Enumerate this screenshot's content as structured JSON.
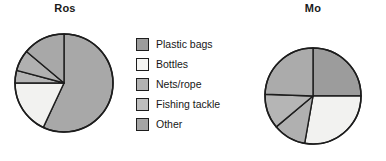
{
  "chart_data": [
    {
      "type": "pie",
      "title": "Ros",
      "categories": [
        "Plastic bags",
        "Bottles",
        "Nets/rope",
        "Fishing tackle",
        "Other"
      ],
      "values": [
        57,
        18,
        4,
        7,
        14
      ],
      "units": "percent",
      "start_angle_deg": 0,
      "direction": "clockwise",
      "legend": "shared",
      "grid": false
    },
    {
      "type": "pie",
      "title": "Mo",
      "categories": [
        "Plastic bags",
        "Bottles",
        "Nets/rope",
        "Fishing tackle",
        "Other"
      ],
      "values": [
        25,
        28,
        11,
        12,
        24
      ],
      "units": "percent",
      "start_angle_deg": 0,
      "direction": "clockwise",
      "legend": "shared",
      "grid": false
    }
  ],
  "charts": {
    "ros": {
      "title": "Ros",
      "slices": [
        {
          "name": "Plastic bags",
          "start": 0,
          "end": 205,
          "fill": "#a8a8a8"
        },
        {
          "name": "Bottles",
          "start": 205,
          "end": 270,
          "fill": "#f2f2f0"
        },
        {
          "name": "Nets/rope",
          "start": 270,
          "end": 285,
          "fill": "#b5b5b5"
        },
        {
          "name": "Fishing tackle",
          "start": 285,
          "end": 310,
          "fill": "#b0b0b0"
        },
        {
          "name": "Other",
          "start": 310,
          "end": 360,
          "fill": "#a8a8a8"
        }
      ]
    },
    "mo": {
      "title": "Mo",
      "slices": [
        {
          "name": "Plastic bags",
          "start": 0,
          "end": 90,
          "fill": "#9c9c9c"
        },
        {
          "name": "Bottles",
          "start": 90,
          "end": 190,
          "fill": "#f2f2f0"
        },
        {
          "name": "Nets/rope",
          "start": 190,
          "end": 230,
          "fill": "#b0b0b0"
        },
        {
          "name": "Fishing tackle",
          "start": 230,
          "end": 272,
          "fill": "#b5b5b5"
        },
        {
          "name": "Other",
          "start": 272,
          "end": 360,
          "fill": "#ababab"
        }
      ]
    }
  },
  "legend": {
    "items": [
      {
        "label": "Plastic bags",
        "color": "#9c9c9c"
      },
      {
        "label": "Bottles",
        "color": "#f4f4f2"
      },
      {
        "label": "Nets/rope",
        "color": "#b2b2b2"
      },
      {
        "label": "Fishing tackle",
        "color": "#bdbdbd"
      },
      {
        "label": "Other",
        "color": "#a5a5a5"
      }
    ]
  },
  "style": {
    "stroke": "#1d1d1d",
    "background": "#ffffff"
  }
}
